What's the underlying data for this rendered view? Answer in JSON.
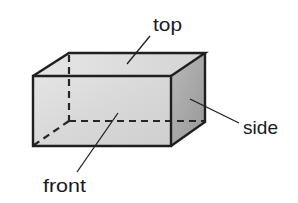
{
  "diagram": {
    "type": "rectangular-prism",
    "labels": {
      "top": "top",
      "side": "side",
      "front": "front"
    },
    "colors": {
      "edge": "#1f1f1f",
      "front_face": "#dcdcdc",
      "top_face": "#e2e2e2",
      "side_face": "#a8a8a8",
      "text": "#1a1a1a"
    }
  }
}
